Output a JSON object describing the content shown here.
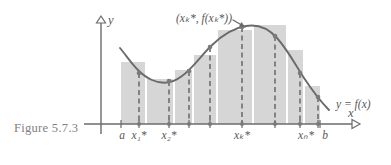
{
  "figure": {
    "caption": "Figure 5.7.3",
    "annotation_point_label": "(xₖ*, f(xₖ*))",
    "curve_label": "y = f(x)",
    "y_axis_label": "y",
    "x_axis_label": "x"
  },
  "axis_tick_labels": [
    {
      "id": "a",
      "text": "a",
      "x": 122
    },
    {
      "id": "x1",
      "text": "x₁*",
      "x": 139
    },
    {
      "id": "x2",
      "text": "x₂*",
      "x": 169
    },
    {
      "id": "xk",
      "text": "xₖ*",
      "x": 242
    },
    {
      "id": "xn",
      "text": "xₙ*",
      "x": 306
    },
    {
      "id": "b",
      "text": "b",
      "x": 325
    }
  ],
  "colors": {
    "bar_fill": "#d6d6d6",
    "curve": "#6b6b6b",
    "axis": "#6b6b6b",
    "dashed_line": "#6e6e6e",
    "point_marker": "#7a7a7a",
    "caption_text": "#808080",
    "label_text": "#585858",
    "background": "#ffffff"
  },
  "chart_data": {
    "type": "area",
    "title": "Figure 5.7.3",
    "subtitle": "Riemann sum approximation of the area under y = f(x) on [a, b]",
    "xlabel": "x",
    "ylabel": "y",
    "grid": false,
    "legend": "none",
    "axes": {
      "y_axis_x_px": 101,
      "x_axis_y_px": 124,
      "x_axis_start_px": 84,
      "x_axis_end_px": 352,
      "y_axis_top_px": 16,
      "interval_start_label": "a",
      "interval_end_label": "b",
      "interval_start_px": 121,
      "interval_end_px": 320
    },
    "curve": {
      "name": "y = f(x)",
      "label": "y = f(x)",
      "label_px": {
        "x": 336,
        "y": 104
      },
      "path_px": "M 120,48 C 130,60 138,74 152,80 C 163,85 173,83 182,76 C 192,69 200,57 211,46 C 222,35 233,28 246,26 C 258,24 268,28 277,38 C 287,49 295,64 304,78 C 312,90 320,101 329,110"
    },
    "annotation": {
      "text": "(xₖ*, f(xₖ*))",
      "text_px": {
        "x": 176,
        "y": 18
      },
      "arrow_from_px": {
        "x": 233,
        "y": 20
      },
      "arrow_to_px": {
        "x": 245,
        "y": 27
      },
      "points_to": "xk"
    },
    "bars": [
      {
        "index": 1,
        "left_px": 121,
        "right_px": 145,
        "top_px": 62,
        "height_px": 62,
        "sample_x_px": 139,
        "sample_y_px": 73,
        "sample_label": "x₁*"
      },
      {
        "index": 2,
        "left_px": 147,
        "right_px": 173,
        "top_px": 79,
        "height_px": 45,
        "sample_x_px": 169,
        "sample_y_px": 81,
        "sample_label": "x₂*"
      },
      {
        "index": 3,
        "left_px": 175,
        "right_px": 192,
        "top_px": 70,
        "height_px": 54,
        "sample_x_px": 189,
        "sample_y_px": 71,
        "sample_label": ""
      },
      {
        "index": 4,
        "left_px": 194,
        "right_px": 216,
        "top_px": 55,
        "height_px": 69,
        "sample_x_px": 210,
        "sample_y_px": 47,
        "sample_label": ""
      },
      {
        "index": 5,
        "left_px": 218,
        "right_px": 252,
        "top_px": 30,
        "height_px": 94,
        "sample_x_px": 242,
        "sample_y_px": 27,
        "sample_label": "xₖ*"
      },
      {
        "index": 6,
        "left_px": 254,
        "right_px": 286,
        "top_px": 25,
        "height_px": 99,
        "sample_x_px": 275,
        "sample_y_px": 36,
        "sample_label": ""
      },
      {
        "index": 7,
        "left_px": 288,
        "right_px": 303,
        "top_px": 50,
        "height_px": 74,
        "sample_x_px": 300,
        "sample_y_px": 73,
        "sample_label": ""
      },
      {
        "index": 8,
        "left_px": 305,
        "right_px": 320,
        "top_px": 86,
        "height_px": 38,
        "sample_x_px": 318,
        "sample_y_px": 97,
        "sample_label": "xₙ*"
      }
    ],
    "sample_points": [
      {
        "label": "x₁*",
        "x_px": 139,
        "curve_y_px": 73
      },
      {
        "label": "x₂*",
        "x_px": 169,
        "curve_y_px": 81
      },
      {
        "label": "",
        "x_px": 189,
        "curve_y_px": 71
      },
      {
        "label": "",
        "x_px": 210,
        "curve_y_px": 47
      },
      {
        "label": "xₖ*",
        "x_px": 242,
        "curve_y_px": 27
      },
      {
        "label": "",
        "x_px": 275,
        "curve_y_px": 36
      },
      {
        "label": "",
        "x_px": 300,
        "curve_y_px": 73
      },
      {
        "label": "xₙ*",
        "x_px": 318,
        "curve_y_px": 97
      }
    ]
  }
}
